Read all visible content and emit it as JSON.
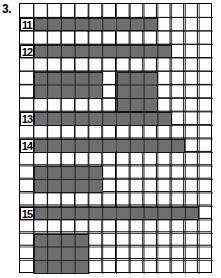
{
  "figure": {
    "number_label": "3.",
    "type": "grid-bar-chart-worksheet"
  },
  "grid": {
    "columns": 14,
    "rows": 20,
    "cell_size_px": 13.8,
    "line_color": "#000000",
    "fill_color": "#6e6e6e",
    "outline_color": "#1a1a1a",
    "background_color": "#ffffff",
    "border_color": "#000000"
  },
  "row_labels": [
    {
      "text": "11",
      "row": 2
    },
    {
      "text": "12",
      "row": 4
    },
    {
      "text": "13",
      "row": 9
    },
    {
      "text": "14",
      "row": 11
    },
    {
      "text": "15",
      "row": 16
    }
  ],
  "chart_data": {
    "type": "bar",
    "title": "3.",
    "xlabel": "",
    "ylabel": "",
    "orientation": "horizontal",
    "grid": true,
    "legend": "none",
    "xlim": [
      0,
      14
    ],
    "ylim": [
      0,
      20
    ],
    "categories": [
      "11",
      "12",
      "13",
      "14",
      "15"
    ],
    "values": [
      9,
      10,
      10,
      11,
      12
    ],
    "bars": [
      {
        "label": "11",
        "row_start": 2,
        "row_end": 2,
        "col_start": 2,
        "col_end": 10,
        "length": 9
      },
      {
        "label": "12",
        "row_start": 4,
        "row_end": 4,
        "col_start": 2,
        "col_end": 11,
        "length": 10
      },
      {
        "label": "",
        "row_start": 6,
        "row_end": 7,
        "col_start": 2,
        "col_end": 6,
        "length": 5
      },
      {
        "label": "",
        "row_start": 6,
        "row_end": 8,
        "col_start": 8,
        "col_end": 10,
        "length": 3
      },
      {
        "label": "13",
        "row_start": 9,
        "row_end": 9,
        "col_start": 2,
        "col_end": 11,
        "length": 10
      },
      {
        "label": "14",
        "row_start": 11,
        "row_end": 11,
        "col_start": 2,
        "col_end": 12,
        "length": 11
      },
      {
        "label": "",
        "row_start": 13,
        "row_end": 14,
        "col_start": 2,
        "col_end": 6,
        "length": 5
      },
      {
        "label": "15",
        "row_start": 16,
        "row_end": 16,
        "col_start": 2,
        "col_end": 13,
        "length": 12
      },
      {
        "label": "",
        "row_start": 18,
        "row_end": 20,
        "col_start": 2,
        "col_end": 5,
        "length": 4
      }
    ]
  }
}
